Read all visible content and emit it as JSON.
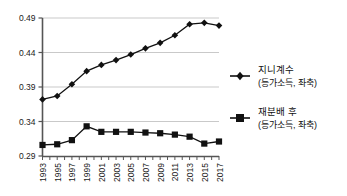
{
  "chart_data": {
    "type": "line",
    "title": "",
    "xlabel": "",
    "ylabel": "",
    "ylim": [
      0.29,
      0.49
    ],
    "xlim": [
      1993,
      2017
    ],
    "grid": true,
    "legend_position": "right",
    "ytick_labels": [
      "0.49",
      "0.44",
      "0.39",
      "0.34",
      "0.29"
    ],
    "ytick_values": [
      0.49,
      0.44,
      0.39,
      0.34,
      0.29
    ],
    "x": [
      1993,
      1994,
      1995,
      1996,
      1997,
      1998,
      1999,
      2000,
      2001,
      2002,
      2003,
      2004,
      2005,
      2006,
      2007,
      2008,
      2009,
      2010,
      2011,
      2012,
      2013,
      2014,
      2015,
      2016,
      2017
    ],
    "xtick_labels": [
      "1993",
      "1995",
      "1997",
      "1999",
      "2001",
      "2003",
      "2005",
      "2007",
      "2009",
      "2011",
      "2013",
      "2015",
      "2017"
    ],
    "xtick_values": [
      1993,
      1995,
      1997,
      1999,
      2001,
      2003,
      2005,
      2007,
      2009,
      2011,
      2013,
      2015,
      2017
    ],
    "series": [
      {
        "name": "지니계수",
        "marker": "diamond",
        "color": "#111111",
        "x": [
          1993,
          1995,
          1997,
          1999,
          2001,
          2003,
          2005,
          2007,
          2009,
          2011,
          2013,
          2015,
          2017
        ],
        "values": [
          0.372,
          0.377,
          0.394,
          0.413,
          0.422,
          0.429,
          0.437,
          0.446,
          0.454,
          0.465,
          0.481,
          0.483,
          0.479
        ]
      },
      {
        "name": "재분배 후",
        "marker": "square",
        "color": "#111111",
        "x": [
          1993,
          1995,
          1997,
          1999,
          2001,
          2003,
          2005,
          2007,
          2009,
          2011,
          2013,
          2015,
          2017
        ],
        "values": [
          0.306,
          0.307,
          0.313,
          0.333,
          0.325,
          0.325,
          0.325,
          0.324,
          0.323,
          0.321,
          0.318,
          0.308,
          0.311
        ]
      }
    ]
  },
  "legend": {
    "entries": [
      {
        "marker": "diamond-marker-icon",
        "label": "지니계수",
        "sublabel": "(등가소득, 좌축)"
      },
      {
        "marker": "square-marker-icon",
        "label": "재분배 후",
        "sublabel": "(등가소득, 좌축)"
      }
    ]
  }
}
